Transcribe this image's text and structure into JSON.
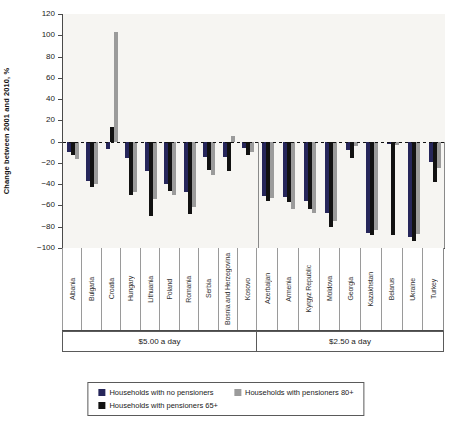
{
  "chart_data": {
    "type": "bar",
    "title": "",
    "xlabel": "",
    "ylabel": "Change between 2001 and 2010, %",
    "ylim": [
      -100,
      120
    ],
    "ytick_step": 20,
    "grid": false,
    "zero_line": "dashed",
    "legend_position": "bottom",
    "group_split_index": 10,
    "groups": [
      {
        "label": "$5.00 a day"
      },
      {
        "label": "$2.50 a day"
      }
    ],
    "categories": [
      "Albania",
      "Bulgaria",
      "Croatia",
      "Hungary",
      "Lithuania",
      "Poland",
      "Romania",
      "Serbia",
      "Bosnia and Herzegovina",
      "Kosovo",
      "Azerbaijan",
      "Armenia",
      "Kyrgyz Republic",
      "Moldova",
      "Georgia",
      "Kazakhstan",
      "Belarus",
      "Ukraine",
      "Turkey"
    ],
    "series": [
      {
        "name": "Households with no pensioners",
        "color": "#26265a",
        "values": [
          -10,
          -37,
          -7,
          -15,
          -28,
          -40,
          -47,
          -14,
          -14,
          -6,
          -51,
          -52,
          -56,
          -67,
          -8,
          -86,
          -2,
          -90,
          -19
        ]
      },
      {
        "name": "Households with pensioners 65+",
        "color": "#121212",
        "values": [
          -13,
          -43,
          14,
          -50,
          -70,
          -46,
          -68,
          -27,
          -28,
          -13,
          -56,
          -57,
          -63,
          -80,
          -15,
          -88,
          -88,
          -93,
          -38
        ]
      },
      {
        "name": "Households with pensioners 80+",
        "color": "#9b9b9b",
        "values": [
          -16,
          -40,
          103,
          -47,
          -54,
          -50,
          -61,
          -31,
          5,
          -10,
          -53,
          -63,
          -67,
          -75,
          -4,
          -83,
          -3,
          -87,
          -25
        ]
      }
    ]
  }
}
